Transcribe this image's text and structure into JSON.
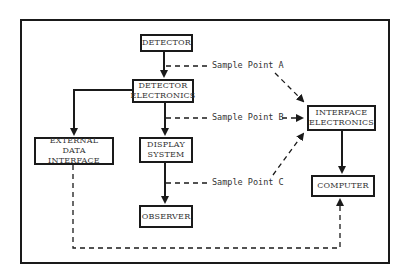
{
  "diagram": {
    "nodes": {
      "detector": "DETECTOR",
      "detector_electronics": "DETECTOR\nELECTRONICS",
      "external_data_interface": "EXTERNAL\nDATA INTERFACE",
      "display_system": "DISPLAY\nSYSTEM",
      "observer": "OBSERVER",
      "interface_electronics": "INTERFACE\nELECTRONICS",
      "computer": "COMPUTER"
    },
    "sample_points": {
      "a": "Sample Point A",
      "b": "Sample Point B",
      "c": "Sample Point C"
    },
    "edges": [
      {
        "from": "detector",
        "to": "detector_electronics",
        "style": "solid"
      },
      {
        "from": "detector_electronics",
        "to": "external_data_interface",
        "style": "solid"
      },
      {
        "from": "detector_electronics",
        "to": "display_system",
        "style": "solid"
      },
      {
        "from": "display_system",
        "to": "observer",
        "style": "solid"
      },
      {
        "from": "interface_electronics",
        "to": "computer",
        "style": "solid"
      },
      {
        "from": "sample_point_a",
        "to": "interface_electronics",
        "style": "dashed"
      },
      {
        "from": "sample_point_b",
        "to": "interface_electronics",
        "style": "dashed"
      },
      {
        "from": "sample_point_c",
        "to": "interface_electronics",
        "style": "dashed"
      },
      {
        "from": "external_data_interface",
        "to": "computer",
        "style": "dashed"
      }
    ],
    "colors": {
      "line": "#1a1a1a",
      "text": "#333333",
      "background": "#ffffff"
    }
  }
}
